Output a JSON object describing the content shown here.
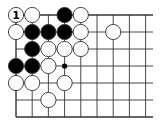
{
  "board": {
    "cols": 9,
    "rows": 7,
    "origin_x": 16,
    "origin_y": 15,
    "spacing_x": 16.2,
    "spacing_y": 17,
    "right_extent": 153,
    "line_color": "#333333",
    "colors": {
      "black": "#000000",
      "white": "#ffffff",
      "stone_outline": "#333333"
    }
  },
  "stones": [
    {
      "col": 0,
      "row": 0,
      "color": "white",
      "label": "1"
    },
    {
      "col": 1,
      "row": 0,
      "color": "white"
    },
    {
      "col": 3,
      "row": 0,
      "color": "black"
    },
    {
      "col": 4,
      "row": 0,
      "color": "white"
    },
    {
      "col": 0,
      "row": 1,
      "color": "white"
    },
    {
      "col": 1,
      "row": 1,
      "color": "black"
    },
    {
      "col": 2,
      "row": 1,
      "color": "black"
    },
    {
      "col": 3,
      "row": 1,
      "color": "black"
    },
    {
      "col": 4,
      "row": 1,
      "color": "white"
    },
    {
      "col": 6,
      "row": 1,
      "color": "white"
    },
    {
      "col": 1,
      "row": 2,
      "color": "black"
    },
    {
      "col": 2,
      "row": 2,
      "color": "white"
    },
    {
      "col": 3,
      "row": 2,
      "color": "white"
    },
    {
      "col": 4,
      "row": 2,
      "color": "white"
    },
    {
      "col": 0,
      "row": 3,
      "color": "black"
    },
    {
      "col": 1,
      "row": 3,
      "color": "black"
    },
    {
      "col": 2,
      "row": 3,
      "color": "white"
    },
    {
      "col": 0,
      "row": 4,
      "color": "white"
    },
    {
      "col": 1,
      "row": 4,
      "color": "white"
    },
    {
      "col": 3,
      "row": 4,
      "color": "white"
    },
    {
      "col": 2,
      "row": 5,
      "color": "white"
    }
  ],
  "markers": [
    {
      "col": 3,
      "row": 3,
      "type": "dot",
      "color": "black"
    }
  ]
}
